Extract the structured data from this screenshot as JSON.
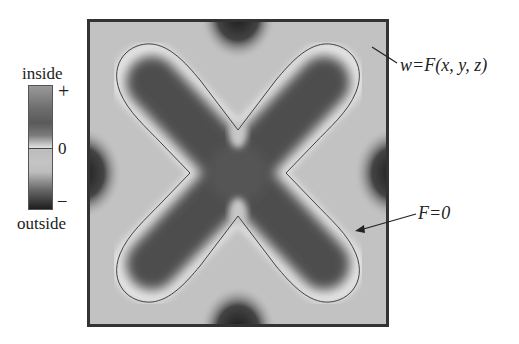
{
  "figure": {
    "legend": {
      "top_label": "inside",
      "bottom_label": "outside",
      "plus_tick": "+",
      "zero_tick": "0",
      "minus_tick": "–"
    },
    "annotations": {
      "field_label": "w=F(x, y, z)",
      "contour_label": "F=0"
    },
    "colors": {
      "outside_level": "#c2c2c2",
      "inside_dark": "#4a4a4a",
      "boundary_halo": "#e6e6e6",
      "outside_dark": "#1e1e1e",
      "frame": "#333333"
    }
  }
}
